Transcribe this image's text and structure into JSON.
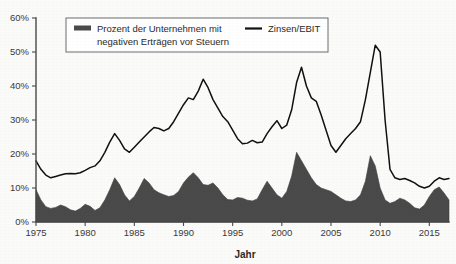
{
  "chart_data": {
    "type": "area",
    "title": "",
    "xlabel": "Jahr",
    "ylabel": "",
    "grid": false,
    "legend_position": "top-inside",
    "xlim": [
      1975,
      2017
    ],
    "ylim": [
      0,
      60
    ],
    "y_tick_labels": [
      "0%",
      "10%",
      "20%",
      "30%",
      "40%",
      "50%",
      "60%"
    ],
    "y_ticks": [
      0,
      10,
      20,
      30,
      40,
      50,
      60
    ],
    "x_tick_labels": [
      "1975",
      "1980",
      "1985",
      "1990",
      "1995",
      "2000",
      "2005",
      "2010",
      "2015"
    ],
    "x_ticks": [
      1975,
      1980,
      1985,
      1990,
      1995,
      2000,
      2005,
      2010,
      2015
    ],
    "series": [
      {
        "name": "Prozent der Unternehmen mit negativen Erträgen vor Steuern",
        "render": "area",
        "color": "#4a4a4a",
        "x": [
          1975.0,
          1975.5,
          1976.0,
          1976.5,
          1977.0,
          1977.5,
          1978.0,
          1978.5,
          1979.0,
          1979.5,
          1980.0,
          1980.5,
          1981.0,
          1981.5,
          1982.0,
          1982.5,
          1983.0,
          1983.5,
          1984.0,
          1984.5,
          1985.0,
          1985.5,
          1986.0,
          1986.5,
          1987.0,
          1987.5,
          1988.0,
          1988.5,
          1989.0,
          1989.5,
          1990.0,
          1990.5,
          1991.0,
          1991.5,
          1992.0,
          1992.5,
          1993.0,
          1993.5,
          1994.0,
          1994.5,
          1995.0,
          1995.5,
          1996.0,
          1996.5,
          1997.0,
          1997.5,
          1998.0,
          1998.5,
          1999.0,
          1999.5,
          2000.0,
          2000.5,
          2001.0,
          2001.5,
          2002.0,
          2002.5,
          2003.0,
          2003.5,
          2004.0,
          2004.5,
          2005.0,
          2005.5,
          2006.0,
          2006.5,
          2007.0,
          2007.5,
          2008.0,
          2008.5,
          2009.0,
          2009.5,
          2010.0,
          2010.5,
          2011.0,
          2011.5,
          2012.0,
          2012.5,
          2013.0,
          2013.5,
          2014.0,
          2014.5,
          2015.0,
          2015.5,
          2016.0,
          2016.5,
          2017.0
        ],
        "values": [
          9.5,
          6.5,
          4.5,
          4.0,
          4.3,
          5.0,
          4.5,
          3.6,
          3.2,
          4.0,
          5.2,
          4.6,
          3.4,
          4.2,
          6.5,
          9.5,
          13.0,
          11.0,
          8.0,
          6.2,
          7.5,
          10.0,
          12.8,
          11.5,
          9.5,
          8.6,
          8.0,
          7.5,
          7.8,
          9.0,
          11.5,
          13.2,
          14.5,
          13.0,
          11.0,
          10.8,
          11.5,
          10.0,
          8.0,
          6.6,
          6.5,
          7.2,
          7.0,
          6.4,
          6.2,
          6.8,
          9.5,
          12.0,
          10.0,
          8.0,
          7.0,
          9.0,
          13.5,
          20.5,
          18.0,
          15.5,
          13.0,
          11.0,
          10.0,
          9.5,
          9.0,
          8.0,
          7.0,
          6.2,
          6.0,
          6.5,
          8.0,
          12.0,
          19.5,
          16.5,
          10.0,
          6.5,
          5.5,
          6.0,
          7.0,
          6.5,
          5.5,
          4.2,
          3.8,
          5.0,
          7.5,
          9.5,
          10.3,
          8.5,
          6.5
        ]
      },
      {
        "name": "Zinsen/EBIT",
        "render": "line",
        "color": "#111111",
        "x": [
          1975.0,
          1975.5,
          1976.0,
          1976.5,
          1977.0,
          1977.5,
          1978.0,
          1978.5,
          1979.0,
          1979.5,
          1980.0,
          1980.5,
          1981.0,
          1981.5,
          1982.0,
          1982.5,
          1983.0,
          1983.5,
          1984.0,
          1984.5,
          1985.0,
          1985.5,
          1986.0,
          1986.5,
          1987.0,
          1987.5,
          1988.0,
          1988.5,
          1989.0,
          1989.5,
          1990.0,
          1990.5,
          1991.0,
          1991.5,
          1992.0,
          1992.5,
          1993.0,
          1993.5,
          1994.0,
          1994.5,
          1995.0,
          1995.5,
          1996.0,
          1996.5,
          1997.0,
          1997.5,
          1998.0,
          1998.5,
          1999.0,
          1999.5,
          2000.0,
          2000.5,
          2001.0,
          2001.5,
          2002.0,
          2002.5,
          2003.0,
          2003.5,
          2004.0,
          2004.5,
          2005.0,
          2005.5,
          2006.0,
          2006.5,
          2007.0,
          2007.5,
          2008.0,
          2008.5,
          2009.0,
          2009.5,
          2010.0,
          2010.5,
          2011.0,
          2011.5,
          2012.0,
          2012.5,
          2013.0,
          2013.5,
          2014.0,
          2014.5,
          2015.0,
          2015.5,
          2016.0,
          2016.5,
          2017.0
        ],
        "values": [
          18.0,
          15.5,
          13.8,
          13.0,
          13.4,
          13.8,
          14.2,
          14.3,
          14.2,
          14.5,
          15.2,
          16.0,
          16.5,
          18.0,
          20.5,
          23.5,
          26.0,
          24.0,
          21.5,
          20.5,
          22.0,
          23.5,
          25.0,
          26.5,
          27.8,
          27.5,
          26.8,
          27.5,
          29.5,
          32.0,
          34.5,
          36.5,
          36.0,
          38.5,
          42.0,
          39.5,
          36.0,
          33.5,
          31.0,
          29.5,
          27.0,
          24.5,
          23.0,
          23.2,
          24.0,
          23.3,
          23.5,
          26.0,
          28.0,
          29.8,
          27.5,
          28.5,
          33.0,
          41.0,
          45.5,
          40.0,
          36.5,
          35.5,
          31.5,
          27.0,
          22.5,
          20.5,
          22.5,
          24.5,
          26.0,
          27.5,
          29.5,
          36.0,
          44.0,
          52.0,
          50.0,
          30.0,
          15.5,
          13.0,
          12.5,
          12.8,
          12.2,
          11.5,
          10.5,
          10.0,
          10.5,
          12.0,
          13.0,
          12.5,
          12.8
        ]
      }
    ]
  },
  "legend": {
    "area_label_line1": "Prozent der Unternehmen mit",
    "area_label_line2": "negativen Erträgen vor Steuern",
    "line_label": "Zinsen/EBIT"
  },
  "axes": {
    "x_title": "Jahr"
  }
}
